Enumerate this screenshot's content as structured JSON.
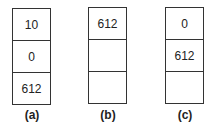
{
  "diagrams": [
    {
      "label": "(a)",
      "cells": [
        "10",
        "0",
        "612"
      ]
    },
    {
      "label": "(b)",
      "cells": [
        "612",
        "",
        ""
      ]
    },
    {
      "label": "(c)",
      "cells": [
        "0",
        "612",
        ""
      ]
    }
  ]
}
